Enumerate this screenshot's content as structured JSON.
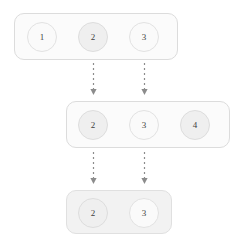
{
  "diagram": {
    "colors": {
      "box_border": "#dcdcdc",
      "box_fill": "#fbfbfb",
      "box_fill_shaded": "#f2f2f2",
      "node_fill": "#efefef",
      "node_border": "#dddddd",
      "node_text": "#3f3f3f",
      "arrow": "#8c8c8c"
    },
    "rows": [
      {
        "name": "row-1",
        "box": {
          "x": 14,
          "y": 13,
          "width": 164,
          "height": 47,
          "shaded": false
        },
        "nodes": [
          {
            "label": "1",
            "cx": 42,
            "cy": 37,
            "style": "plain"
          },
          {
            "label": "2",
            "cx": 93,
            "cy": 37,
            "style": "filled"
          },
          {
            "label": "3",
            "cx": 144,
            "cy": 37,
            "style": "plain"
          }
        ]
      },
      {
        "name": "row-2",
        "box": {
          "x": 66,
          "y": 101,
          "width": 164,
          "height": 47,
          "shaded": false
        },
        "nodes": [
          {
            "label": "2",
            "cx": 93,
            "cy": 125,
            "style": "filled"
          },
          {
            "label": "3",
            "cx": 144,
            "cy": 125,
            "style": "plain"
          },
          {
            "label": "4",
            "cx": 195,
            "cy": 125,
            "style": "filled"
          }
        ]
      },
      {
        "name": "row-3",
        "box": {
          "x": 66,
          "y": 190,
          "width": 106,
          "height": 44,
          "shaded": true
        },
        "nodes": [
          {
            "label": "2",
            "cx": 93,
            "cy": 213,
            "style": "filled"
          },
          {
            "label": "3",
            "cx": 144,
            "cy": 213,
            "style": "plain"
          }
        ]
      }
    ],
    "arrows": [
      {
        "name": "arrow-row1-to-row2-left",
        "x": 93,
        "y_start": 63,
        "y_end": 95
      },
      {
        "name": "arrow-row1-to-row2-right",
        "x": 144,
        "y_start": 63,
        "y_end": 95
      },
      {
        "name": "arrow-row2-to-row3-left",
        "x": 93,
        "y_start": 152,
        "y_end": 184
      },
      {
        "name": "arrow-row2-to-row3-right",
        "x": 144,
        "y_start": 152,
        "y_end": 184
      }
    ]
  }
}
